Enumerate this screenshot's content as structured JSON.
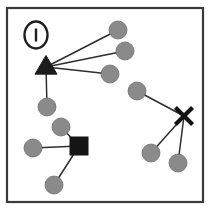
{
  "figure": {
    "panel_label": "1",
    "panel_label_shape": "ellipse-outline",
    "background_color": "#ffffff",
    "frame": {
      "x": 7,
      "y": 8,
      "width": 196,
      "height": 194,
      "stroke_color": "#3a3a3a",
      "stroke_width": 2.2
    }
  },
  "legend": {
    "circle_color": "#8a8a8a",
    "hub_color": "#1c1c1c",
    "edge_color": "#2e2e2e"
  },
  "chart_data": {
    "type": "scatter",
    "xlabel": "",
    "ylabel": "",
    "xlim": [
      0,
      210
    ],
    "ylim": [
      0,
      210
    ],
    "grid": false,
    "legend_position": "none",
    "nodes": [
      {
        "id": "t1",
        "shape": "triangle",
        "x": 46,
        "y": 67,
        "size": 11,
        "color": "#1c1c1c",
        "role": "hub"
      },
      {
        "id": "c1",
        "shape": "circle",
        "x": 118,
        "y": 30,
        "size": 9,
        "color": "#8a8a8a",
        "role": "leaf"
      },
      {
        "id": "c2",
        "shape": "circle",
        "x": 125,
        "y": 51,
        "size": 9,
        "color": "#8a8a8a",
        "role": "leaf"
      },
      {
        "id": "c3",
        "shape": "circle",
        "x": 110,
        "y": 74,
        "size": 9,
        "color": "#8a8a8a",
        "role": "leaf"
      },
      {
        "id": "c4",
        "shape": "circle",
        "x": 47,
        "y": 107,
        "size": 9,
        "color": "#8a8a8a",
        "role": "leaf"
      },
      {
        "id": "x1",
        "shape": "cross",
        "x": 184,
        "y": 116,
        "size": 9,
        "color": "#111111",
        "role": "hub"
      },
      {
        "id": "c5",
        "shape": "circle",
        "x": 137,
        "y": 91,
        "size": 9,
        "color": "#8a8a8a",
        "role": "leaf"
      },
      {
        "id": "c6",
        "shape": "circle",
        "x": 151,
        "y": 153,
        "size": 9,
        "color": "#8a8a8a",
        "role": "leaf"
      },
      {
        "id": "c7",
        "shape": "circle",
        "x": 178,
        "y": 163,
        "size": 9,
        "color": "#8a8a8a",
        "role": "leaf"
      },
      {
        "id": "s1",
        "shape": "square",
        "x": 79,
        "y": 146,
        "size": 9,
        "color": "#151515",
        "role": "hub"
      },
      {
        "id": "c8",
        "shape": "circle",
        "x": 61,
        "y": 127,
        "size": 9,
        "color": "#8a8a8a",
        "role": "leaf"
      },
      {
        "id": "c9",
        "shape": "circle",
        "x": 33,
        "y": 148,
        "size": 9,
        "color": "#8a8a8a",
        "role": "leaf"
      },
      {
        "id": "c10",
        "shape": "circle",
        "x": 54,
        "y": 185,
        "size": 9,
        "color": "#8a8a8a",
        "role": "leaf"
      }
    ],
    "edges": [
      {
        "source": "t1",
        "target": "c1"
      },
      {
        "source": "t1",
        "target": "c2"
      },
      {
        "source": "t1",
        "target": "c3"
      },
      {
        "source": "t1",
        "target": "c4"
      },
      {
        "source": "x1",
        "target": "c5"
      },
      {
        "source": "x1",
        "target": "c6"
      },
      {
        "source": "x1",
        "target": "c7"
      },
      {
        "source": "s1",
        "target": "c8"
      },
      {
        "source": "s1",
        "target": "c9"
      },
      {
        "source": "s1",
        "target": "c10"
      }
    ],
    "clusters": [
      {
        "hub": "t1",
        "hub_shape": "triangle",
        "leaf_count": 4
      },
      {
        "hub": "x1",
        "hub_shape": "cross",
        "leaf_count": 3
      },
      {
        "hub": "s1",
        "hub_shape": "square",
        "leaf_count": 3
      }
    ]
  }
}
